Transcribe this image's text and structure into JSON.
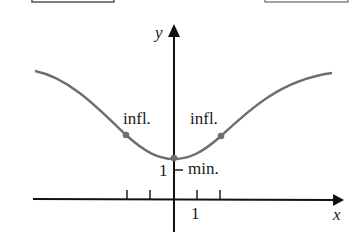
{
  "figure": {
    "type": "function-graph",
    "labels": {
      "y_axis": "y",
      "x_axis": "x",
      "x_tick_label": "1",
      "y_tick_label": "1",
      "left_inflection": "infl.",
      "right_inflection": "infl.",
      "minimum": "min."
    },
    "points": {
      "minimum": {
        "x": 0,
        "y": 1
      },
      "left_inflection": {
        "x": -2
      },
      "right_inflection": {
        "x": 2
      }
    },
    "x_ticks": [
      -2,
      -1,
      1,
      2
    ],
    "y_ticks": [
      1
    ],
    "colors": {
      "curve": "#6e6e6e",
      "axes": "#111111",
      "points": "#6e6e6e",
      "box_border": "#555555"
    }
  }
}
